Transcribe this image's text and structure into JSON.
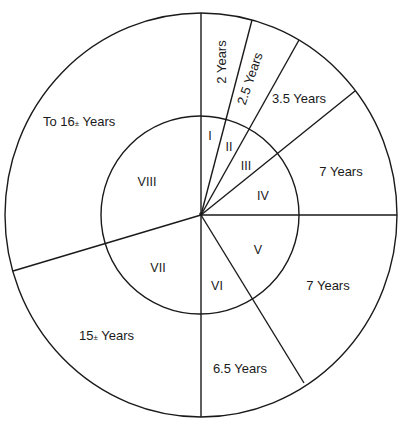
{
  "diagram": {
    "type": "concentric-sector-diagram",
    "colors": {
      "line": "#1a1a1a",
      "background": "#ffffff",
      "text": "#1a1a1a"
    },
    "sectors": [
      {
        "id": "I",
        "roman": "I",
        "outer_label": "2 Years"
      },
      {
        "id": "II",
        "roman": "II",
        "outer_label": "2.5 Years"
      },
      {
        "id": "III",
        "roman": "III",
        "outer_label": "3.5 Years"
      },
      {
        "id": "IV",
        "roman": "IV",
        "outer_label": "7 Years"
      },
      {
        "id": "V",
        "roman": "V",
        "outer_label": "7 Years"
      },
      {
        "id": "VI",
        "roman": "VI",
        "outer_label": "6.5 Years"
      },
      {
        "id": "VII",
        "roman": "VII",
        "outer_label_prefix": "15",
        "outer_label_pm": "±",
        "outer_label_suffix": " Years"
      },
      {
        "id": "VIII",
        "roman": "VIII",
        "outer_label_prefix": "To 16",
        "outer_label_pm": "±",
        "outer_label_suffix": " Years"
      }
    ]
  }
}
